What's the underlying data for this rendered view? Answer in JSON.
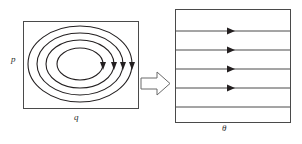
{
  "figure": {
    "title": "",
    "background_color": "#ffffff",
    "stroke_color": "#231f20",
    "width": 302,
    "height": 144
  },
  "left_panel": {
    "name": "closed-loop-field-box",
    "rect": {
      "x": 23,
      "y": 21,
      "width": 115,
      "height": 87
    },
    "labels": {
      "left_label": "p",
      "bottom_label": "q"
    },
    "contours": {
      "type": "concentric-ellipses",
      "count": 4,
      "center": {
        "cx": 80,
        "cy": 64
      },
      "radii": [
        {
          "rx": 23,
          "ry": 16
        },
        {
          "rx": 34,
          "ry": 24
        },
        {
          "rx": 43,
          "ry": 31
        },
        {
          "rx": 52,
          "ry": 38
        }
      ],
      "arrow_direction": "clockwise",
      "arrow_side": "right"
    }
  },
  "transform_arrow": {
    "name": "block-arrow-right",
    "direction": "right",
    "x": 141,
    "y": 72,
    "width": 28,
    "height": 22
  },
  "right_panel": {
    "name": "parallel-field-box",
    "rect": {
      "x": 175,
      "y": 9,
      "width": 115,
      "height": 113
    },
    "labels": {
      "bottom_label": "θ"
    },
    "field_lines": {
      "type": "horizontal-parallel-lines",
      "count": 5,
      "y_positions": [
        31,
        50,
        69,
        88,
        107
      ],
      "arrow_direction": "right",
      "arrow_x": 233,
      "arrowed_lines": [
        0,
        1,
        2,
        3
      ]
    }
  }
}
